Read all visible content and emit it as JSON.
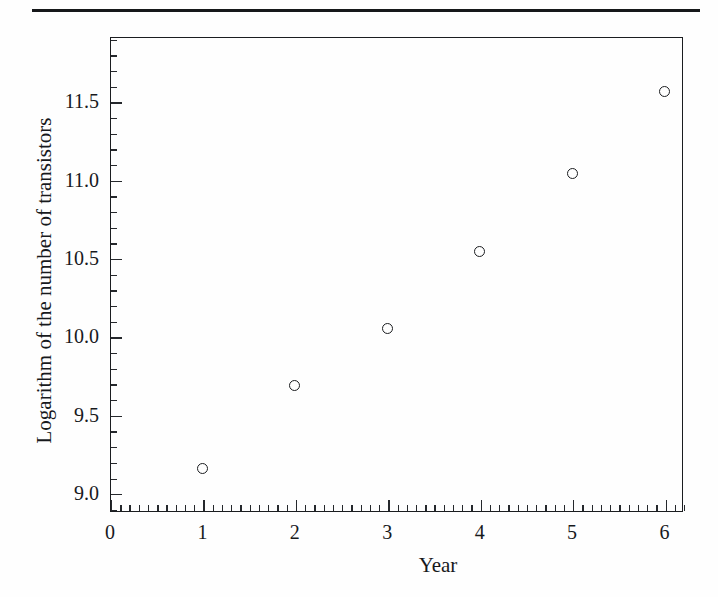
{
  "page": {
    "background_color": "#fefefe",
    "rule_color": "#16181a",
    "has_top_rule": true
  },
  "chart_data": {
    "type": "scatter",
    "title": "",
    "xlabel": "Year",
    "ylabel": "Logarithm of the number of transistors",
    "x": [
      1,
      2,
      3,
      4,
      5,
      6
    ],
    "values": [
      9.16,
      9.69,
      10.05,
      10.54,
      11.04,
      11.56
    ],
    "points": [
      {
        "x": 1,
        "y": 9.16
      },
      {
        "x": 2,
        "y": 9.69
      },
      {
        "x": 3,
        "y": 10.05
      },
      {
        "x": 4,
        "y": 10.54
      },
      {
        "x": 5,
        "y": 11.04
      },
      {
        "x": 6,
        "y": 11.56
      }
    ],
    "xlim": [
      0,
      6.2
    ],
    "ylim": [
      8.88,
      11.91
    ],
    "xticks": [
      0,
      1,
      2,
      3,
      4,
      5,
      6
    ],
    "xtick_labels": [
      "0",
      "1",
      "2",
      "3",
      "4",
      "5",
      "6"
    ],
    "yticks": [
      9.0,
      9.5,
      10.0,
      10.5,
      11.0,
      11.5
    ],
    "ytick_labels": [
      "9.0",
      "9.5",
      "10.0",
      "10.5",
      "11.0",
      "11.5"
    ],
    "x_minor_tick_step": 0.1,
    "y_minor_tick_step": 0.1,
    "grid": false,
    "legend": false,
    "marker": "open-circle",
    "marker_color": "#1b1d20",
    "axis_color": "#1b1d20",
    "frame": "box"
  }
}
